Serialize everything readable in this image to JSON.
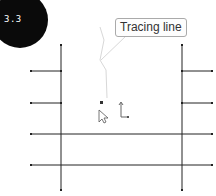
{
  "step_badge": {
    "label": "3.3",
    "color": "#0a0a0a"
  },
  "tooltip": {
    "label": "Tracing line"
  },
  "drawing": {
    "line_color": "#222222",
    "trace_color": "#d8d8d8",
    "vertical_lines": [
      {
        "x": 61,
        "y1": 45,
        "y2": 190
      },
      {
        "x": 182,
        "y1": 45,
        "y2": 190
      }
    ],
    "horizontal_lines": [
      {
        "x1": 31,
        "x2": 61,
        "y": 71
      },
      {
        "x1": 182,
        "x2": 212,
        "y": 71
      },
      {
        "x1": 31,
        "x2": 61,
        "y": 103
      },
      {
        "x1": 182,
        "x2": 212,
        "y": 103
      },
      {
        "x1": 31,
        "x2": 212,
        "y": 134
      },
      {
        "x1": 31,
        "x2": 212,
        "y": 165
      }
    ]
  },
  "cursor": {
    "icon": "arrow-cursor-icon"
  },
  "axis_indicator": {
    "icon": "axis-icon"
  }
}
